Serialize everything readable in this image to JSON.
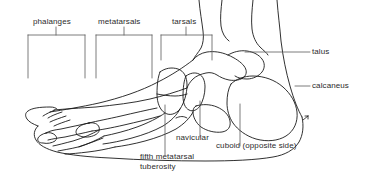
{
  "figure": {
    "background_color": "#ffffff",
    "line_color": "#1a1a1a",
    "leader_line_color": "#4d4d4d",
    "text_color": "#2b2b2b"
  },
  "bracket_labels": [
    {
      "id": "phalanges",
      "label": "phalanges"
    },
    {
      "id": "metatarsals",
      "label": "metatarsals"
    },
    {
      "id": "tarsals",
      "label": "tarsals"
    }
  ],
  "right_labels": [
    {
      "id": "talus",
      "label": "talus"
    },
    {
      "id": "calcaneus",
      "label": "calcaneus"
    }
  ],
  "bottom_labels": [
    {
      "id": "navicular",
      "label": "navicular"
    },
    {
      "id": "cuboid",
      "label": "cuboid (opposite side)"
    },
    {
      "id": "fifth-metatarsal-tuberosity",
      "label": "fifth metatarsal\ntuberosity"
    }
  ]
}
